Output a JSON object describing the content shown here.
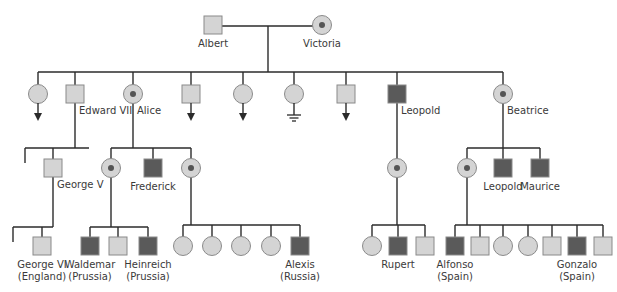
{
  "colors": {
    "line": "#2b2b2b",
    "unaffected_fill": "#d4d4d4",
    "affected_fill": "#5a5a5a",
    "carrier_dot": "#555555",
    "stroke": "#8a8a8a"
  },
  "legend_symbols": {
    "square": "male",
    "circle": "female",
    "dark-square": "affected male",
    "dotted-circle": "carrier female",
    "arrow": "has descendants (not shown)",
    "ground": "no descendants"
  },
  "people": [
    {
      "id": "albert",
      "sex": "male",
      "status": "unaffected",
      "label": [
        "Albert"
      ]
    },
    {
      "id": "victoria",
      "sex": "female",
      "status": "carrier",
      "label": [
        "Victoria"
      ]
    },
    {
      "id": "g2-1",
      "sex": "female",
      "status": "unaffected",
      "marker": "arrow",
      "label": []
    },
    {
      "id": "edward7",
      "sex": "male",
      "status": "unaffected",
      "label": [
        "Edward VII"
      ]
    },
    {
      "id": "alice",
      "sex": "female",
      "status": "carrier",
      "label": [
        "Alice"
      ]
    },
    {
      "id": "g2-4",
      "sex": "male",
      "status": "unaffected",
      "marker": "arrow",
      "label": []
    },
    {
      "id": "g2-5",
      "sex": "female",
      "status": "unaffected",
      "marker": "arrow",
      "label": []
    },
    {
      "id": "g2-6",
      "sex": "female",
      "status": "unaffected",
      "marker": "ground",
      "label": []
    },
    {
      "id": "g2-7",
      "sex": "male",
      "status": "unaffected",
      "marker": "arrow",
      "label": []
    },
    {
      "id": "leopold1",
      "sex": "male",
      "status": "affected",
      "label": [
        "Leopold"
      ]
    },
    {
      "id": "beatrice",
      "sex": "female",
      "status": "carrier",
      "label": [
        "Beatrice"
      ]
    },
    {
      "id": "george5",
      "sex": "male",
      "status": "unaffected",
      "label": [
        "George V"
      ]
    },
    {
      "id": "alice-c1",
      "sex": "female",
      "status": "carrier",
      "label": []
    },
    {
      "id": "frederick",
      "sex": "male",
      "status": "affected",
      "label": [
        "Frederick"
      ]
    },
    {
      "id": "alice-c3",
      "sex": "female",
      "status": "carrier",
      "label": []
    },
    {
      "id": "leopold-c1",
      "sex": "female",
      "status": "carrier",
      "label": []
    },
    {
      "id": "beatrice-c1",
      "sex": "female",
      "status": "carrier",
      "label": []
    },
    {
      "id": "leopold2",
      "sex": "male",
      "status": "affected",
      "label": [
        "Leopold"
      ]
    },
    {
      "id": "maurice",
      "sex": "male",
      "status": "affected",
      "label": [
        "Maurice"
      ]
    },
    {
      "id": "george6",
      "sex": "male",
      "status": "unaffected",
      "label": [
        "George VI",
        "(England)"
      ]
    },
    {
      "id": "waldemar",
      "sex": "male",
      "status": "affected",
      "label": [
        "Waldemar",
        "(Prussia)"
      ]
    },
    {
      "id": "prussia-2",
      "sex": "male",
      "status": "unaffected",
      "label": []
    },
    {
      "id": "heinreich",
      "sex": "male",
      "status": "affected",
      "label": [
        "Heinreich",
        "(Prussia)"
      ]
    },
    {
      "id": "russia-1",
      "sex": "female",
      "status": "unaffected",
      "label": []
    },
    {
      "id": "russia-2",
      "sex": "female",
      "status": "unaffected",
      "label": []
    },
    {
      "id": "russia-3",
      "sex": "female",
      "status": "unaffected",
      "label": []
    },
    {
      "id": "russia-4",
      "sex": "female",
      "status": "unaffected",
      "label": []
    },
    {
      "id": "alexis",
      "sex": "male",
      "status": "affected",
      "label": [
        "Alexis",
        "(Russia)"
      ]
    },
    {
      "id": "rupert-sis",
      "sex": "female",
      "status": "unaffected",
      "label": []
    },
    {
      "id": "rupert",
      "sex": "male",
      "status": "affected",
      "label": [
        "Rupert"
      ]
    },
    {
      "id": "rupert-bro",
      "sex": "male",
      "status": "unaffected",
      "label": []
    },
    {
      "id": "alfonso",
      "sex": "male",
      "status": "affected",
      "label": [
        "Alfonso",
        "(Spain)"
      ]
    },
    {
      "id": "spain-2",
      "sex": "male",
      "status": "unaffected",
      "label": []
    },
    {
      "id": "spain-3",
      "sex": "female",
      "status": "unaffected",
      "label": []
    },
    {
      "id": "spain-4",
      "sex": "female",
      "status": "unaffected",
      "label": []
    },
    {
      "id": "spain-5",
      "sex": "male",
      "status": "unaffected",
      "label": []
    },
    {
      "id": "gonzalo",
      "sex": "male",
      "status": "affected",
      "label": [
        "Gonzalo",
        "(Spain)"
      ]
    },
    {
      "id": "spain-7",
      "sex": "male",
      "status": "unaffected",
      "label": []
    }
  ]
}
